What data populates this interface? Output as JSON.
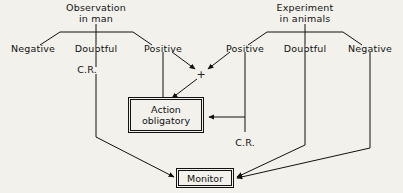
{
  "diagram": {
    "title_left": {
      "line1": "Observation",
      "line2": "in man"
    },
    "title_right": {
      "line1": "Experiment",
      "line2": "in animals"
    },
    "left_branches": {
      "negative": "Negative",
      "doubtful": "Doubtful",
      "positive": "Positive"
    },
    "right_branches": {
      "positive": "Positive",
      "doubtful": "Doubtful",
      "negative": "Negative"
    },
    "annotations": {
      "cr_left": "C.R.",
      "cr_right": "C.R.",
      "plus": "+"
    },
    "boxes": {
      "action": {
        "line1": "Action",
        "line2": "obligatory"
      },
      "monitor": {
        "line1": "Monitor"
      }
    },
    "colors": {
      "background": "#f3f1ec",
      "ink": "#111111"
    }
  }
}
